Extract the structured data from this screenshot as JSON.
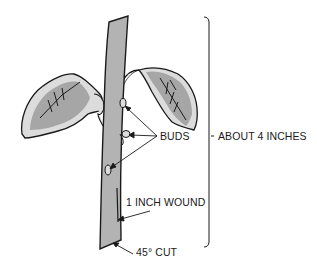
{
  "diagram": {
    "labels": {
      "buds": "BUDS",
      "length": "ABOUT 4 INCHES",
      "wound": "1 INCH WOUND",
      "cut": "45° CUT"
    },
    "colors": {
      "stem_fill": "#b3b3b3",
      "leaf_fill": "#a6a6a6",
      "leaf_highlight": "#dcdcdc",
      "outline": "#1a1a1a",
      "background": "#ffffff"
    },
    "parts": [
      "stem",
      "left-leaf",
      "right-leaf",
      "bud-1",
      "bud-2",
      "bud-3",
      "wound",
      "bracket"
    ]
  }
}
